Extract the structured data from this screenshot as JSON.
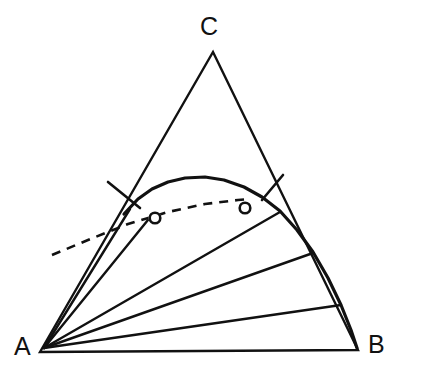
{
  "figure": {
    "type": "ternary-phase-diagram",
    "width": 425,
    "height": 385,
    "background_color": "#ffffff",
    "line_color": "#111111"
  },
  "labels": {
    "vertex_a": "A",
    "vertex_b": "B",
    "vertex_c": "C"
  },
  "chart_data": {
    "type": "scatter",
    "title": "",
    "xlabel": "",
    "ylabel": "",
    "subtitle": "",
    "grid": false,
    "legend": "none",
    "diagram_kind": "ternary composition triangle with binodal curve and tie-lines",
    "components": [
      "A",
      "B",
      "C"
    ],
    "triangle": {
      "vertex_a": [
        40,
        352
      ],
      "vertex_b": [
        358,
        350
      ],
      "vertex_c": [
        213,
        52
      ],
      "stroke_width": 2.4
    },
    "binodal_curve": {
      "name": "binodal (solvus) curve",
      "style": "solid",
      "stroke_width": 3.2,
      "points": [
        [
          124,
          214
        ],
        [
          138,
          199
        ],
        [
          152,
          189
        ],
        [
          168,
          182
        ],
        [
          185,
          178
        ],
        [
          205,
          177
        ],
        [
          224,
          180
        ],
        [
          244,
          187
        ],
        [
          262,
          197
        ],
        [
          280,
          211
        ],
        [
          297,
          230
        ],
        [
          313,
          252
        ],
        [
          328,
          278
        ],
        [
          341,
          305
        ],
        [
          351,
          330
        ],
        [
          357,
          348
        ]
      ]
    },
    "dashed_line": {
      "name": "conjugate / critical tie-line",
      "style": "dashed",
      "stroke_width": 2.6,
      "dash_pattern": "9 7",
      "points": [
        [
          52,
          255
        ],
        [
          88,
          240
        ],
        [
          128,
          224
        ],
        [
          168,
          212
        ],
        [
          205,
          204
        ],
        [
          238,
          200
        ],
        [
          250,
          199
        ]
      ]
    },
    "tie_lines": [
      {
        "name": "tie-line-1",
        "from": [
          44,
          348
        ],
        "to": [
          130,
          209
        ],
        "stroke_width": 2.4
      },
      {
        "name": "tie-line-2",
        "from": [
          44,
          348
        ],
        "to": [
          152,
          215
        ],
        "stroke_width": 2.4
      },
      {
        "name": "tie-line-3",
        "from": [
          44,
          348
        ],
        "to": [
          280,
          212
        ],
        "stroke_width": 2.4
      },
      {
        "name": "tie-line-4",
        "from": [
          44,
          348
        ],
        "to": [
          313,
          253
        ],
        "stroke_width": 2.4
      },
      {
        "name": "tie-line-5",
        "from": [
          44,
          348
        ],
        "to": [
          341,
          305
        ],
        "stroke_width": 2.4
      }
    ],
    "edge_ticks": [
      {
        "name": "tick-left-edge",
        "from": [
          108,
          182
        ],
        "to": [
          140,
          208
        ],
        "stroke_width": 2.6
      },
      {
        "name": "tick-right-edge",
        "from": [
          283,
          175
        ],
        "to": [
          262,
          200
        ],
        "stroke_width": 2.6
      }
    ],
    "markers": [
      {
        "name": "plait-point-left",
        "shape": "open-circle",
        "center": [
          155,
          218
        ],
        "radius": 6.5
      },
      {
        "name": "plait-point-right",
        "shape": "open-circle",
        "center": [
          245,
          208
        ],
        "radius": 6.5
      }
    ]
  }
}
